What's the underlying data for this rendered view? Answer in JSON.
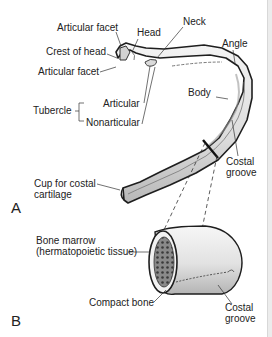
{
  "figure": {
    "panel_a": {
      "letter": "A",
      "labels": {
        "articular_facet_top": "Articular facet",
        "head": "Head",
        "neck": "Neck",
        "crest_of_head": "Crest of head",
        "angle": "Angle",
        "articular_facet_bottom": "Articular facet",
        "body": "Body",
        "tubercle": "Tubercle",
        "articular": "Articular",
        "nonarticular": "Nonarticular",
        "costal_groove_line1": "Costal",
        "costal_groove_line2": "groove",
        "cup_line1": "Cup for costal",
        "cup_line2": "cartilage"
      }
    },
    "panel_b": {
      "letter": "B",
      "labels": {
        "bone_marrow_line1": "Bone marrow",
        "bone_marrow_line2": "(hermatopoietic tissue)",
        "compact_bone": "Compact bone",
        "costal_groove_line1": "Costal",
        "costal_groove_line2": "groove"
      }
    },
    "colors": {
      "ink": "#222222",
      "bone_fill": "#e6e6e6",
      "bone_shadow": "#bdbdbd",
      "marrow": "#6e6e6e"
    }
  }
}
